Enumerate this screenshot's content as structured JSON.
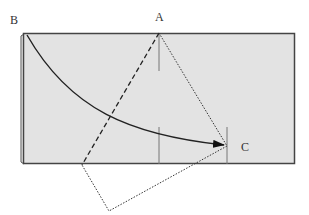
{
  "diagram": {
    "type": "geometric-fold-diagram",
    "labels": {
      "a": "A",
      "b": "B",
      "c": "C"
    },
    "colors": {
      "paper_fill": "#e3e3e3",
      "paper_stroke": "#444444",
      "line": "#222222",
      "label": "#333333",
      "background": "#ffffff"
    },
    "points": {
      "A": [
        159,
        33
      ],
      "C": [
        227,
        146
      ],
      "bottom_vertex": [
        109,
        211
      ],
      "crease_bottom": [
        82,
        164
      ],
      "arc_start": [
        27,
        35
      ]
    }
  }
}
